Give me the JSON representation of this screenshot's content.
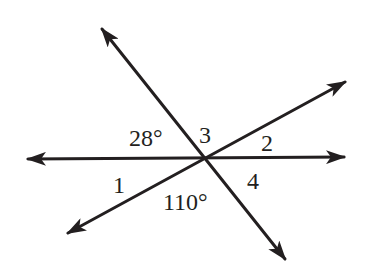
{
  "diagram": {
    "type": "intersecting-lines",
    "stroke_color": "#231f20",
    "background": "#ffffff",
    "intersection": {
      "x": 206,
      "y": 159
    },
    "lines": [
      {
        "name": "horizontal-line",
        "from": {
          "x": 26,
          "y": 159
        },
        "to": {
          "x": 346,
          "y": 157
        }
      },
      {
        "name": "descending-line",
        "from": {
          "x": 101,
          "y": 27
        },
        "to": {
          "x": 286,
          "y": 261
        }
      },
      {
        "name": "ascending-line",
        "from": {
          "x": 66,
          "y": 234
        },
        "to": {
          "x": 347,
          "y": 81
        }
      }
    ],
    "labels": {
      "angle_28": "28°",
      "angle_3": "3",
      "angle_2": "2",
      "angle_1": "1",
      "angle_110": "110°",
      "angle_4": "4"
    }
  }
}
